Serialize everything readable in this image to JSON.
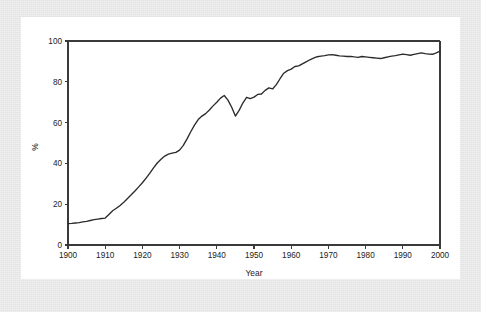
{
  "chart_data": {
    "type": "line",
    "title": "",
    "xlabel": "Year",
    "ylabel": "%",
    "xlim": [
      1900,
      2000
    ],
    "ylim": [
      0,
      100
    ],
    "grid": false,
    "legend": null,
    "xticks": [
      "1900",
      "1910",
      "1920",
      "1930",
      "1940",
      "1950",
      "1960",
      "1970",
      "1980",
      "1990",
      "2000"
    ],
    "xtick_values": [
      1900,
      1910,
      1920,
      1930,
      1940,
      1950,
      1960,
      1970,
      1980,
      1990,
      2000
    ],
    "yticks": [
      "0",
      "20",
      "40",
      "60",
      "80",
      "100"
    ],
    "ytick_values": [
      0,
      20,
      40,
      60,
      80,
      100
    ],
    "series": [
      {
        "name": "",
        "color": "#2b2b2b",
        "x": [
          1900,
          1901,
          1902,
          1903,
          1904,
          1905,
          1906,
          1907,
          1908,
          1909,
          1910,
          1911,
          1912,
          1913,
          1914,
          1915,
          1916,
          1917,
          1918,
          1919,
          1920,
          1921,
          1922,
          1923,
          1924,
          1925,
          1926,
          1927,
          1928,
          1929,
          1930,
          1931,
          1932,
          1933,
          1934,
          1935,
          1936,
          1937,
          1938,
          1939,
          1940,
          1941,
          1942,
          1943,
          1944,
          1945,
          1946,
          1947,
          1948,
          1949,
          1950,
          1951,
          1952,
          1953,
          1954,
          1955,
          1956,
          1957,
          1958,
          1959,
          1960,
          1961,
          1962,
          1963,
          1964,
          1965,
          1966,
          1967,
          1968,
          1969,
          1970,
          1971,
          1972,
          1973,
          1974,
          1975,
          1976,
          1977,
          1978,
          1979,
          1980,
          1981,
          1982,
          1983,
          1984,
          1985,
          1986,
          1987,
          1988,
          1989,
          1990,
          1991,
          1992,
          1993,
          1994,
          1995,
          1996,
          1997,
          1998,
          1999,
          2000
        ],
        "y": [
          10.5,
          10.6,
          10.8,
          11.0,
          11.3,
          11.6,
          12.0,
          12.4,
          12.7,
          13.0,
          13.2,
          15.0,
          16.8,
          18.0,
          19.4,
          21.0,
          22.8,
          24.6,
          26.5,
          28.5,
          30.5,
          32.8,
          35.2,
          37.8,
          40.2,
          42.0,
          43.6,
          44.5,
          45.0,
          45.4,
          46.5,
          48.8,
          52.0,
          55.5,
          58.8,
          61.5,
          63.2,
          64.4,
          66.2,
          68.2,
          70.0,
          72.0,
          73.3,
          71.0,
          67.5,
          63.2,
          66.0,
          69.6,
          72.4,
          71.8,
          72.5,
          73.8,
          74.0,
          75.8,
          77.0,
          76.5,
          78.6,
          81.5,
          84.2,
          85.5,
          86.2,
          87.5,
          87.8,
          88.8,
          89.8,
          90.8,
          91.6,
          92.3,
          92.6,
          92.8,
          93.2,
          93.3,
          93.0,
          92.7,
          92.6,
          92.4,
          92.5,
          92.2,
          92.0,
          92.4,
          92.2,
          92.0,
          91.8,
          91.6,
          91.4,
          91.8,
          92.2,
          92.6,
          92.8,
          93.2,
          93.6,
          93.3,
          93.0,
          93.4,
          93.8,
          94.2,
          93.8,
          93.6,
          93.5,
          94.2,
          95.0
        ]
      }
    ]
  },
  "figure": {
    "background_color": "#ffffff",
    "mat_color": "#e8e8e8",
    "line_color": "#2b2b2b",
    "axis_color": "#3a3a3a"
  }
}
